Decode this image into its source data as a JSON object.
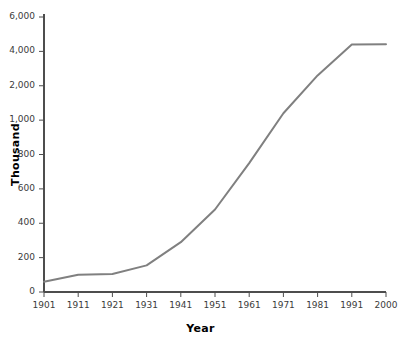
{
  "chart_data": {
    "type": "line",
    "title": "",
    "xlabel": "Year",
    "ylabel": "Thousand",
    "grid": false,
    "legend": "none",
    "line_color": "#808080",
    "axis_color": "#4d4d4d",
    "x": [
      1901,
      1911,
      1921,
      1931,
      1941,
      1951,
      1961,
      1971,
      1981,
      1991,
      2000
    ],
    "xtick_labels": [
      "1901",
      "1911",
      "1921",
      "1931",
      "1941",
      "1951",
      "1961",
      "1971",
      "1981",
      "1991",
      "2000"
    ],
    "values": [
      60,
      100,
      105,
      155,
      290,
      480,
      750,
      1200,
      2600,
      4400,
      4420
    ],
    "ytick_values": [
      0,
      200,
      400,
      600,
      800,
      1000,
      2000,
      4000,
      6000
    ],
    "ytick_labels": [
      "0",
      "200",
      "400",
      "600",
      "800",
      "1,000",
      "2,000",
      "4,000",
      "6,000"
    ],
    "yaxis_note": "broken/compressed scale: ticks evenly spaced though spacing represents 200 below 1,000 and 1,000-2,000 steps above",
    "ylim": [
      0,
      6000
    ]
  }
}
